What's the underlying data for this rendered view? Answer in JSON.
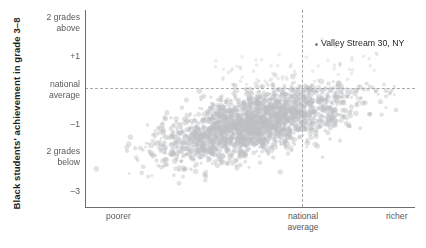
{
  "chart_data": {
    "type": "scatter",
    "title": "",
    "xlabel": "",
    "ylabel": "Black students' achievement in grade 3–8",
    "x_tick_labels": [
      "poorer",
      "national\naverage",
      "richer"
    ],
    "y_tick_labels": [
      "2 grades\nabove",
      "+1",
      "national\naverage",
      "–1",
      "2 grades\nbelow",
      "–3"
    ],
    "y_tick_values": [
      2,
      1,
      0,
      -1,
      -2,
      -3
    ],
    "ylim": [
      -3.6,
      2.3
    ],
    "xlim": [
      -2.6,
      1.9
    ],
    "grid": false,
    "legend": null,
    "reference_lines": [
      {
        "orientation": "horizontal",
        "value": 0,
        "label": "national average",
        "style": "dashed"
      },
      {
        "orientation": "vertical",
        "value": 0,
        "label": "national average",
        "style": "dashed"
      }
    ],
    "point_color": "#bcbec0",
    "point_opacity": 0.45,
    "point_radius": 2.1,
    "n_points": 2300,
    "annotations": [
      {
        "label": "Valley Stream 30, NY",
        "x": 0.23,
        "y": 1.44,
        "marker": true
      }
    ],
    "series": [
      {
        "name": "school districts",
        "description": "Each point is a school district; x = district socioeconomic status (poorer to richer), y = Black students' average achievement in grades 3-8 relative to national average. Cloud trends upward to the right; densest just below national average near the vertical reference line; almost all districts fall below the national-average achievement line.",
        "trend": {
          "slope": 0.52,
          "intercept": -0.95
        },
        "x_mean": -0.35,
        "y_mean": -1.15,
        "x_sd": 0.62,
        "y_sd": 0.55
      }
    ]
  },
  "axis": {
    "y_title": "Black students' achievement in grade 3–8",
    "y_ticks": [
      {
        "label": "2 grades\nabove",
        "top": 12
      },
      {
        "label": "+1",
        "top": 51
      },
      {
        "label": "national\naverage",
        "top": 79
      },
      {
        "label": "–1",
        "top": 119
      },
      {
        "label": "2 grades\nbelow",
        "top": 146
      },
      {
        "label": "–3",
        "top": 186
      }
    ],
    "x_ticks": {
      "poorer": "poorer",
      "national_average": "national\naverage",
      "richer": "richer"
    }
  },
  "annotation": {
    "valley_stream": "Valley Stream 30, NY"
  },
  "colors": {
    "point": "#bcbec0",
    "axis": "#6d6e71",
    "reference": "#a7a9ac",
    "text": "#58595b",
    "title_text": "#231f20",
    "background": "#ffffff"
  }
}
